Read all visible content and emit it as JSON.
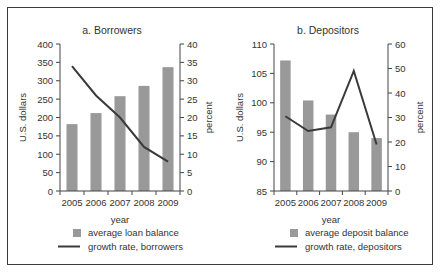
{
  "chart_data": [
    {
      "type": "bar+line",
      "title": "a.  Borrowers",
      "xlabel": "year",
      "ylabel": "U.S. dollars",
      "y2label": "percent",
      "categories": [
        "2005",
        "2006",
        "2007",
        "2008",
        "2009"
      ],
      "ylim": [
        0,
        400
      ],
      "y_ticks": [
        0,
        50,
        100,
        150,
        200,
        250,
        300,
        350,
        400
      ],
      "y2lim": [
        0,
        40
      ],
      "y2_ticks": [
        0,
        5,
        10,
        15,
        20,
        25,
        30,
        35,
        40
      ],
      "series": [
        {
          "name": "average loan balance",
          "type": "bar",
          "axis": "left",
          "color": "#999999",
          "values": [
            182,
            212,
            258,
            286,
            337
          ]
        },
        {
          "name": "growth rate, borrowers",
          "type": "line",
          "axis": "right",
          "color": "#3a3a3a",
          "values": [
            34,
            26,
            20,
            12,
            8
          ]
        }
      ],
      "legend_position": "bottom",
      "grid": false
    },
    {
      "type": "bar+line",
      "title": "b.  Depositors",
      "xlabel": "year",
      "ylabel": "U.S. dollars",
      "y2label": "percent",
      "categories": [
        "2005",
        "2006",
        "2007",
        "2008",
        "2009"
      ],
      "ylim": [
        85,
        110
      ],
      "y_ticks": [
        85,
        90,
        95,
        100,
        105,
        110
      ],
      "y2lim": [
        0,
        60
      ],
      "y2_ticks": [
        0,
        10,
        20,
        30,
        40,
        50,
        60
      ],
      "series": [
        {
          "name": "average deposit balance",
          "type": "bar",
          "axis": "left",
          "color": "#999999",
          "values": [
            107.2,
            100.4,
            98.0,
            95.0,
            94.0
          ]
        },
        {
          "name": "growth rate, depositors",
          "type": "line",
          "axis": "right",
          "color": "#3a3a3a",
          "values": [
            30.5,
            24.5,
            26,
            49,
            19
          ]
        }
      ],
      "legend_position": "bottom",
      "grid": false
    }
  ]
}
